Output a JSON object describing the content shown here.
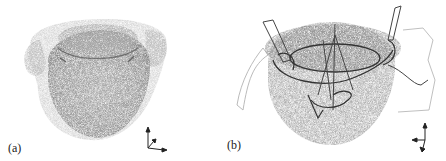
{
  "figure": {
    "panels": [
      {
        "id": "a",
        "label": "(a)",
        "description": "stippled 3D surface rendering of a rounded body with outer translucent shell",
        "axes_icon": "3d-axes-indicator"
      },
      {
        "id": "b",
        "label": "(b)",
        "description": "stippled 3D surface rendering with overlaid line-drawn structures",
        "axes_icon": "3d-axes-indicator"
      }
    ],
    "colors": {
      "background": "#ffffff",
      "surface_dark": "#8a8a8a",
      "surface_light": "#c8c8c8",
      "lines": "#333333"
    }
  }
}
